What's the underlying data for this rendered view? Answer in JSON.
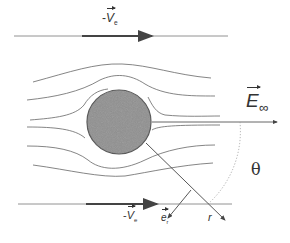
{
  "diagram": {
    "labels": {
      "top_velocity": {
        "prefix": "-",
        "symbol": "V",
        "subscript": "e"
      },
      "bottom_velocity": {
        "prefix": "-",
        "symbol": "V",
        "subscript": "e"
      },
      "field": {
        "symbol": "E",
        "subscript": "∞"
      },
      "unit_vector": {
        "symbol": "e",
        "subscript": "r"
      },
      "radius": "r",
      "angle": "θ"
    },
    "colors": {
      "line": "#555555",
      "sphere_fill": "#8f8f8f",
      "sphere_stroke": "#555555",
      "text": "#333333"
    }
  }
}
